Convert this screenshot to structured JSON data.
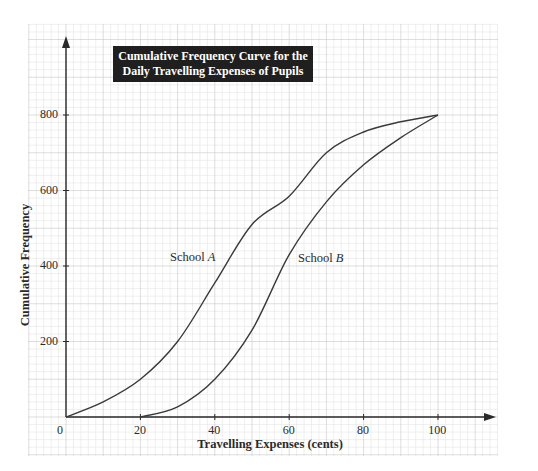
{
  "chart_data": {
    "type": "line",
    "title": "Cumulative Frequency Curve for the Daily Travelling Expenses of Pupils",
    "title_lines": [
      "Cumulative Frequency Curve for the",
      "Daily Travelling Expenses of Pupils"
    ],
    "xlabel": "Travelling Expenses (cents)",
    "ylabel": "Cumulative Frequency",
    "xlim": [
      0,
      115
    ],
    "ylim": [
      0,
      1000
    ],
    "x_ticks": [
      0,
      20,
      40,
      60,
      80,
      100
    ],
    "y_ticks": [
      200,
      400,
      600,
      800
    ],
    "grid": true,
    "legend": "inline labels",
    "series": [
      {
        "name": "School A",
        "label_prefix": "School ",
        "label_letter": "A",
        "x": [
          0,
          10,
          20,
          30,
          40,
          50,
          60,
          70,
          80,
          90,
          100
        ],
        "y": [
          0,
          40,
          100,
          200,
          355,
          510,
          585,
          700,
          755,
          782,
          800
        ]
      },
      {
        "name": "School B",
        "label_prefix": "School ",
        "label_letter": "B",
        "x": [
          20,
          30,
          40,
          50,
          60,
          70,
          80,
          90,
          100
        ],
        "y": [
          0,
          27,
          100,
          230,
          430,
          570,
          668,
          740,
          800
        ]
      }
    ]
  },
  "colors": {
    "curve": "#3a3a3a",
    "axis": "#2a2a2a",
    "grid_major": "#c8c8c8",
    "grid_minor": "#e4e4e4",
    "title_bg": "#1f1f1f",
    "title_fg": "#ffffff"
  }
}
